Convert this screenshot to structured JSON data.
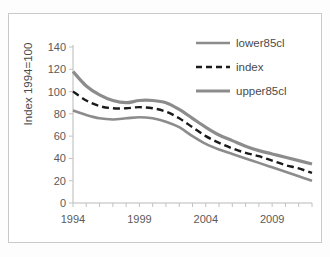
{
  "figure": {
    "border_color": "#c9c9c9",
    "background": "#ffffff"
  },
  "chart_data": {
    "type": "line",
    "title": "",
    "xlabel": "",
    "ylabel": "Index 1994=100",
    "xlim": [
      1994,
      2012
    ],
    "ylim": [
      0,
      140
    ],
    "ytick_labels": [
      "0",
      "20",
      "40",
      "60",
      "80",
      "100",
      "120",
      "140"
    ],
    "ytick_values": [
      0,
      20,
      40,
      60,
      80,
      100,
      120,
      140
    ],
    "xtick_labels": [
      "1994",
      "1999",
      "2004",
      "2009"
    ],
    "xtick_values": [
      1994,
      1999,
      2004,
      2009
    ],
    "x": [
      1994,
      1995,
      1996,
      1997,
      1998,
      1999,
      2000,
      2001,
      2002,
      2003,
      2004,
      2005,
      2006,
      2007,
      2008,
      2009,
      2010,
      2011,
      2012
    ],
    "grid": false,
    "legend_position": "top-right",
    "series": [
      {
        "name": "lower85cl",
        "color": "#8c8c8c",
        "style": "solid",
        "width": 2.6,
        "values": [
          83,
          79,
          76,
          75,
          76,
          77,
          76,
          73,
          68,
          60,
          53,
          48,
          44,
          40,
          36,
          32,
          28,
          24,
          20
        ]
      },
      {
        "name": "index",
        "color": "#1a1a1a",
        "style": "dashed",
        "width": 2.4,
        "values": [
          100,
          92,
          87,
          85,
          85,
          86,
          85,
          82,
          76,
          68,
          60,
          54,
          49,
          45,
          42,
          38,
          34,
          31,
          27
        ]
      },
      {
        "name": "upper85cl",
        "color": "#8c8c8c",
        "style": "solid",
        "width": 3.2,
        "values": [
          118,
          105,
          97,
          92,
          90,
          92,
          92,
          90,
          84,
          76,
          68,
          61,
          56,
          51,
          47,
          44,
          41,
          38,
          35
        ]
      }
    ]
  },
  "legend": {
    "items": [
      {
        "label": "lower85cl",
        "swatch": "solid-gray-line"
      },
      {
        "label": "index",
        "swatch": "dashed-black-line"
      },
      {
        "label": "upper85cl",
        "swatch": "thick-gray-line"
      }
    ]
  }
}
